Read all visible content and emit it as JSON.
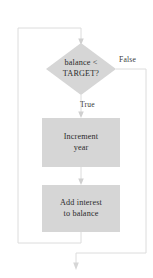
{
  "diagram": {
    "type": "flowchart",
    "title": "",
    "colors": {
      "node_fill": "#d6d6d6",
      "line": "#d8d8d8",
      "text": "#2b2b2b"
    },
    "nodes": [
      {
        "id": "decision",
        "shape": "diamond",
        "label": "balance <\nTARGET?"
      },
      {
        "id": "increment",
        "shape": "rectangle",
        "label": "Increment\nyear"
      },
      {
        "id": "interest",
        "shape": "rectangle",
        "label": "Add interest\nto balance"
      }
    ],
    "edges": [
      {
        "id": "loop-back",
        "from": "interest",
        "to": "decision",
        "label": ""
      },
      {
        "id": "decision-false",
        "from": "decision",
        "to": "exit",
        "label": "False"
      },
      {
        "id": "decision-true",
        "from": "decision",
        "to": "increment",
        "label": "True"
      },
      {
        "id": "increment-to-interest",
        "from": "increment",
        "to": "interest",
        "label": ""
      }
    ]
  }
}
